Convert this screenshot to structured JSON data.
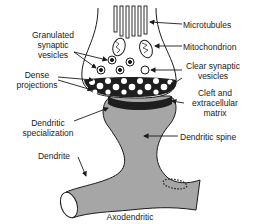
{
  "diagram": {
    "title": "Axodendritic",
    "labels": {
      "granulated_vesicles": [
        "Granulated",
        "synaptic",
        "vesicles"
      ],
      "dense_projections": [
        "Dense",
        "projections"
      ],
      "dendritic_specialization": [
        "Dendritic",
        "specialization"
      ],
      "dendrite": "Dendrite",
      "microtubules": "Microtubules",
      "mitochondrion": "Mitochondrion",
      "clear_vesicles": [
        "Clear synaptic",
        "vesicles"
      ],
      "cleft": [
        "Cleft and",
        "extracellular",
        "matrix"
      ],
      "dendritic_spine": "Dendritic spine"
    },
    "colors": {
      "terminal_fill": "#ffffff",
      "postsynaptic_fill": "#a6a6a6",
      "dense_fill": "#1e1e1e",
      "outline": "#1a1a1a"
    }
  }
}
